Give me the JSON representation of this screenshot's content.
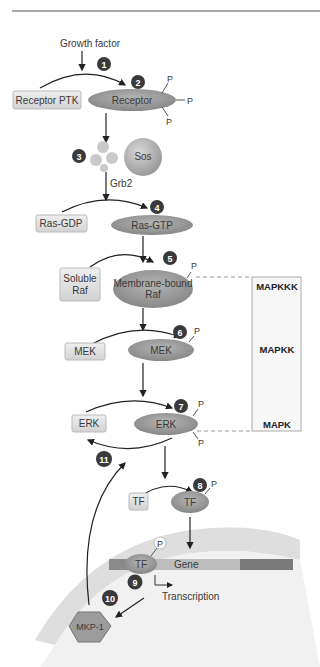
{
  "diagram": {
    "growth_factor": "Growth factor",
    "receptor_ptk": "Receptor PTK",
    "receptor": "Receptor",
    "phosphate": "P",
    "sos": "Sos",
    "grb2": "Grb2",
    "ras_gdp": "Ras-GDP",
    "ras_gtp": "Ras-GTP",
    "soluble_raf_1": "Soluble",
    "soluble_raf_2": "Raf",
    "membrane_raf_1": "Membrane-bound",
    "membrane_raf_2": "Raf",
    "mek_inactive": "MEK",
    "mek_active": "MEK",
    "erk_inactive": "ERK",
    "erk_active": "ERK",
    "tf_inactive": "TF",
    "tf_active": "TF",
    "tf_gene": "TF",
    "gene": "Gene",
    "transcription": "Transcription",
    "mkp1": "MKP-1",
    "levels": {
      "mapkkk": "MAPKKK",
      "mapkk": "MAPKK",
      "mapk": "MAPK"
    },
    "steps": [
      "1",
      "2",
      "3",
      "4",
      "5",
      "6",
      "7",
      "8",
      "9",
      "10",
      "11"
    ]
  },
  "colors": {
    "protein_fill": "#9a9a9a",
    "box_fill": "#e2e2e2",
    "step_badge": "#3a3a3a",
    "nucleus": "#e6e6e6",
    "gene_dark": "#7a7a7a",
    "gene_light": "#bdbdbd"
  }
}
